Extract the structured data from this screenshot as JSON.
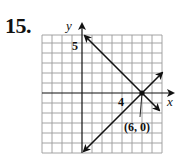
{
  "problem": {
    "number": "15."
  },
  "graph": {
    "x_axis_label": "x",
    "y_axis_label": "y",
    "tick_labels": {
      "x_tick": "4",
      "y_tick": "5"
    },
    "grid": {
      "x_min": -4,
      "x_max": 8,
      "y_min": -6,
      "y_max": 5.8,
      "step": 1
    },
    "point_label": "(6, 0)",
    "intersection_point": {
      "x": 6,
      "y": 0
    },
    "lines": [
      {
        "name": "line-1",
        "equation": "y = -x + 6",
        "slope": -1,
        "intercept": 6,
        "from": [
          0.2,
          5.6
        ],
        "to": [
          7.5,
          -1.8
        ]
      },
      {
        "name": "line-2",
        "equation": "y = x - 6",
        "slope": 1,
        "intercept": -6,
        "from": [
          0,
          -6
        ],
        "to": [
          8,
          2
        ]
      }
    ],
    "colors": {
      "grid": "#9a9a9a",
      "axis": "#111111",
      "line": "#111111",
      "background": "#ffffff"
    }
  }
}
